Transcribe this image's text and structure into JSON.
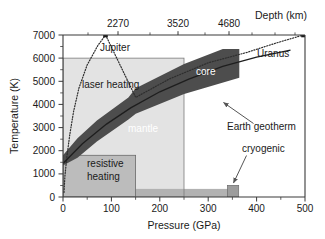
{
  "figure": {
    "background": "#ffffff",
    "frame_color": "#555555"
  },
  "axes": {
    "x_bottom": {
      "title": "Pressure (GPa)",
      "ticks": [
        0,
        100,
        200,
        300,
        400,
        500
      ],
      "tick_labels": [
        "0",
        "100",
        "200",
        "300",
        "400",
        "500"
      ],
      "min": 0,
      "max": 500,
      "minor_step": 25
    },
    "x_top": {
      "title": "Depth (km)",
      "ticks": [
        97,
        207,
        310
      ],
      "tick_labels": [
        "2270",
        "3520",
        "4680"
      ],
      "minor_ticks": [
        50,
        150,
        260,
        360,
        420,
        470
      ]
    },
    "y_left": {
      "title": "Temperature (K)",
      "ticks": [
        0,
        1000,
        2000,
        3000,
        4000,
        5000,
        6000,
        7000
      ],
      "tick_labels": [
        "0",
        "1000",
        "2000",
        "3000",
        "4000",
        "5000",
        "6000",
        "7000"
      ],
      "min": 0,
      "max": 7000
    }
  },
  "regions": {
    "laser_heating": {
      "label": "laser heating",
      "color": "#e2e2e2",
      "x_range": [
        0,
        250
      ],
      "y_range": [
        0,
        6000
      ]
    },
    "resistive_heating": {
      "label": "resistive heating",
      "label_line1": "resistive",
      "label_line2": "heating",
      "color": "#b8b8b8",
      "x_range": [
        0,
        150
      ],
      "y_range": [
        0,
        1800
      ]
    },
    "cryogenic_strip": {
      "label": "cryogenic",
      "color": "#b0b0b0",
      "x_range": [
        0,
        360
      ],
      "y_range": [
        0,
        350
      ]
    },
    "cryogenic_box": {
      "color": "#9a9a9a",
      "x_range": [
        340,
        362
      ],
      "y_range": [
        0,
        500
      ]
    }
  },
  "bands": {
    "earth_interior": {
      "color": "#4a4a4a",
      "mantle_label": "mantle",
      "core_label": "core",
      "upper_boundary": [
        {
          "p": 0,
          "t": 1800
        },
        {
          "p": 30,
          "t": 2450
        },
        {
          "p": 70,
          "t": 3300
        },
        {
          "p": 135,
          "t": 4300
        },
        {
          "p": 150,
          "t": 4700
        },
        {
          "p": 250,
          "t": 5750
        },
        {
          "p": 330,
          "t": 6400
        },
        {
          "p": 364,
          "t": 6400
        }
      ],
      "lower_boundary": [
        {
          "p": 0,
          "t": 1280
        },
        {
          "p": 30,
          "t": 1700
        },
        {
          "p": 70,
          "t": 2400
        },
        {
          "p": 135,
          "t": 3350
        },
        {
          "p": 150,
          "t": 3600
        },
        {
          "p": 250,
          "t": 4450
        },
        {
          "p": 364,
          "t": 5150
        }
      ]
    }
  },
  "curves": {
    "jupiter": {
      "label": "Jupiter",
      "style": "dotted",
      "color": "#333333",
      "points": [
        {
          "p": 2,
          "t": 200
        },
        {
          "p": 4,
          "t": 900
        },
        {
          "p": 8,
          "t": 1750
        },
        {
          "p": 14,
          "t": 2700
        },
        {
          "p": 22,
          "t": 3700
        },
        {
          "p": 33,
          "t": 4700
        },
        {
          "p": 50,
          "t": 5700
        },
        {
          "p": 72,
          "t": 6550
        },
        {
          "p": 88,
          "t": 7000
        }
      ],
      "endpoint_marker": {
        "p": 88,
        "t": 7000
      }
    },
    "uranus": {
      "label": "Uranus",
      "style": "dotted",
      "color": "#333333",
      "points": [
        {
          "p": 88,
          "t": 7000
        },
        {
          "p": 150,
          "t": 4300
        },
        {
          "p": 220,
          "t": 5100
        },
        {
          "p": 300,
          "t": 5800
        },
        {
          "p": 380,
          "t": 6250
        },
        {
          "p": 440,
          "t": 6650
        },
        {
          "p": 497,
          "t": 7000
        }
      ],
      "endpoint_marker": {
        "p": 497,
        "t": 7000
      }
    },
    "earth_geotherm": {
      "label": "Earth geotherm",
      "style": "solid",
      "color": "#222222",
      "points": [
        {
          "p": 0,
          "t": 1450
        },
        {
          "p": 40,
          "t": 2300
        },
        {
          "p": 90,
          "t": 3150
        },
        {
          "p": 140,
          "t": 3850
        },
        {
          "p": 200,
          "t": 4550
        },
        {
          "p": 260,
          "t": 5100
        },
        {
          "p": 330,
          "t": 5650
        },
        {
          "p": 400,
          "t": 6050
        },
        {
          "p": 470,
          "t": 6350
        }
      ]
    }
  },
  "annotations": {
    "earth_geotherm": {
      "text": "Earth geotherm",
      "arrow_from": {
        "p": 330,
        "t": 3700
      },
      "arrow_to": {
        "p": 250,
        "t": 4750
      }
    },
    "cryogenic": {
      "text": "cryogenic",
      "arrow_from": {
        "p": 318,
        "t": 1100
      },
      "arrow_to": {
        "p": 348,
        "t": 520
      }
    }
  }
}
